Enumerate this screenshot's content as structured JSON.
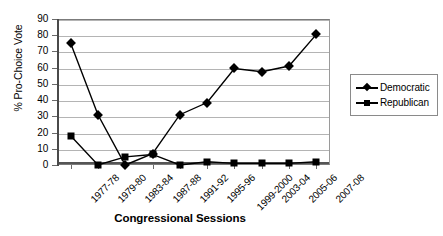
{
  "chart_data": {
    "type": "line",
    "title": "",
    "xlabel": "Congressional Sessions",
    "ylabel": "% Pro-Choice Vote",
    "ylim": [
      0,
      90
    ],
    "ytick_step": 10,
    "yticks": [
      "90",
      "80",
      "70",
      "60",
      "50",
      "40",
      "30",
      "20",
      "10",
      "0"
    ],
    "grid": true,
    "legend_position": "right",
    "categories": [
      "1977-78",
      "1979-80",
      "1983-84",
      "1987-88",
      "1991-92",
      "1995-96",
      "1999-2000",
      "2003-04",
      "2005-06",
      "2007-08"
    ],
    "series": [
      {
        "name": "Democratic",
        "marker": "diamond",
        "color": "#000000",
        "values": [
          75,
          31,
          0,
          7,
          31,
          38.5,
          59.5,
          57.5,
          61,
          80.5
        ]
      },
      {
        "name": "Republican",
        "marker": "square",
        "color": "#000000",
        "values": [
          18,
          0,
          5,
          6.5,
          0,
          2,
          1,
          1,
          1,
          2
        ]
      }
    ]
  },
  "legend": {
    "items": [
      {
        "label": "Democratic"
      },
      {
        "label": "Republican"
      }
    ]
  }
}
